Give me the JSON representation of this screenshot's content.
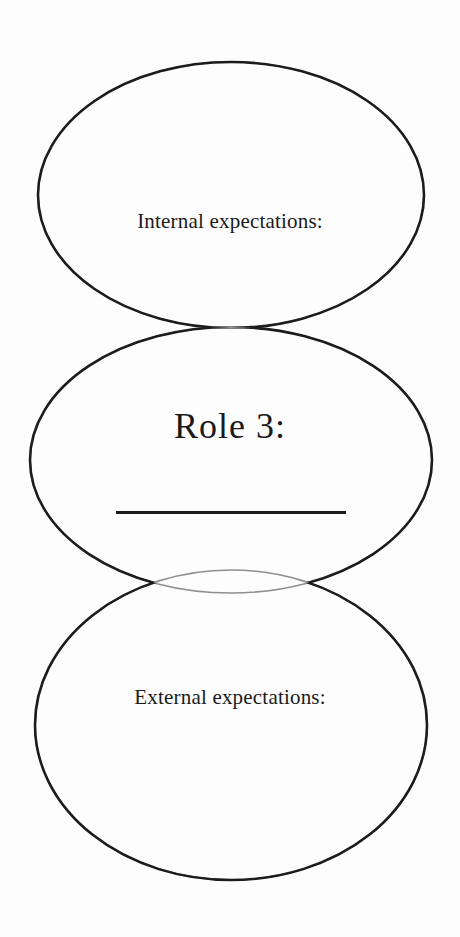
{
  "diagram": {
    "type": "venn",
    "background_color": "#fdfdfd",
    "stroke_color": "#1c1c1c",
    "faint_stroke_color": "#8a8a8a",
    "text_color": "#1a1a1a",
    "circles": [
      {
        "id": "top",
        "label": "Internal expectations:",
        "cx": 231,
        "cy": 195,
        "rx": 193,
        "ry": 133
      },
      {
        "id": "middle",
        "label": "Role 3:",
        "cx": 231,
        "cy": 460,
        "rx": 201,
        "ry": 133
      },
      {
        "id": "bottom",
        "label": "External expectations:",
        "cx": 231,
        "cy": 725,
        "rx": 196,
        "ry": 155
      }
    ],
    "labels": {
      "internal": "Internal expectations:",
      "role": "Role 3:",
      "external": "External expectations:"
    },
    "answer_blank": {
      "present": true,
      "value": "",
      "x": 116,
      "y": 511,
      "width": 230
    }
  }
}
